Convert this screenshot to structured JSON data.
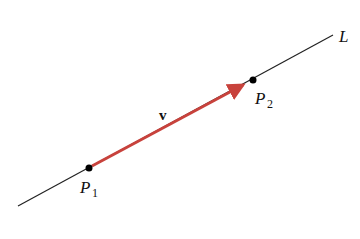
{
  "diagram": {
    "line_label": "L",
    "vector_label": "v",
    "points": [
      {
        "name": "P",
        "sub": "1",
        "x": 89,
        "y": 168
      },
      {
        "name": "P",
        "sub": "2",
        "x": 253,
        "y": 80
      }
    ],
    "line": {
      "x1": 18,
      "y1": 206,
      "x2": 333,
      "y2": 35,
      "color": "#222222"
    },
    "vector": {
      "x1": 92,
      "y1": 166,
      "x2": 249,
      "y2": 82,
      "color": "#c8423c"
    }
  }
}
